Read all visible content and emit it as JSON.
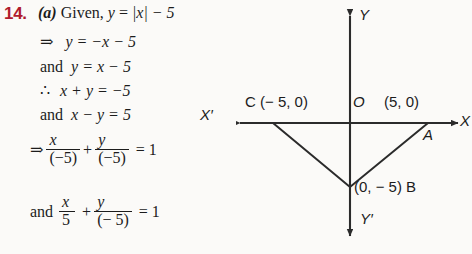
{
  "question": {
    "number": "14.",
    "part": "(a)",
    "prompt_prefix": "Given,",
    "given_lhs": "y",
    "given_eq": "=",
    "given_rhs": "|x| − 5"
  },
  "steps": [
    {
      "symbol": "⇒",
      "text": "y = −x − 5"
    },
    {
      "symbol": "and",
      "text": "y = x − 5"
    },
    {
      "symbol": "∴",
      "text": "x + y = −5"
    },
    {
      "symbol": "and",
      "text": "x − y = 5"
    }
  ],
  "equations": [
    {
      "lead": "⇒",
      "term1_num": "x",
      "term1_den": "(−5)",
      "plus": "+",
      "term2_num": "y",
      "term2_den": "(−5)",
      "equals": "= 1"
    },
    {
      "lead": "and",
      "term1_num": "x",
      "term1_den": "5",
      "plus": "+",
      "term2_num": "y",
      "term2_den": "(− 5)",
      "equals": "= 1"
    }
  ],
  "graph": {
    "axis_labels": {
      "y_positive": "Y",
      "y_negative": "Y′",
      "x_positive": "X",
      "x_negative": "X′",
      "origin": "O"
    },
    "points": [
      {
        "name": "C",
        "label": "C (− 5, 0)",
        "x": -5,
        "y": 0
      },
      {
        "name": "A",
        "label": "(5, 0)",
        "x": 5,
        "y": 0
      },
      {
        "name": "A_marker",
        "label": "A",
        "x": 5,
        "y": 0
      },
      {
        "name": "B",
        "label": "(0, − 5) B",
        "x": 0,
        "y": -5
      }
    ],
    "curve": {
      "type": "absolute-value",
      "equation": "y = |x| − 5",
      "vertices": [
        [
          -5,
          0
        ],
        [
          0,
          -5
        ],
        [
          5,
          0
        ]
      ]
    },
    "stroke_color": "#2b2b2b"
  },
  "colors": {
    "question_number": "#b01b2e",
    "ink": "#1c1c1c",
    "paper": "#fbfaf8"
  }
}
